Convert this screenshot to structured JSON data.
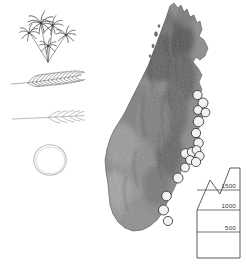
{
  "figure": {
    "background_color": "#ffffff"
  },
  "specimens": {
    "items": [
      {
        "id": "habit",
        "icon": "palm-cluster-icon",
        "label": "Palm habit (cluster of four palms)"
      },
      {
        "id": "leaf",
        "icon": "pinnate-leaf-icon",
        "label": "Pinnate leaf / frond"
      },
      {
        "id": "inflorescence",
        "icon": "branch-icon",
        "label": "Inflorescence branch"
      },
      {
        "id": "fruit",
        "icon": "fruit-circle-icon",
        "label": "Fruit (circular outline)"
      }
    ]
  },
  "map": {
    "name": "Madagascar",
    "relief_shading": true,
    "land_color": "#7d7d7d",
    "ocean_color": "#ffffff",
    "marker": {
      "shape": "circle",
      "fill": "#f2f2f2",
      "stroke": "#2b2b2b",
      "count": 18,
      "description": "Collection / occurrence localities along the eastern escarpment"
    },
    "occurrences": [
      {
        "x": 111.5,
        "y": 95.0,
        "r": 4.6
      },
      {
        "x": 117.0,
        "y": 103.0,
        "r": 5.0
      },
      {
        "x": 112.0,
        "y": 110.0,
        "r": 4.4
      },
      {
        "x": 119.5,
        "y": 112.5,
        "r": 4.4
      },
      {
        "x": 112.5,
        "y": 121.5,
        "r": 5.2
      },
      {
        "x": 110.0,
        "y": 133.0,
        "r": 4.6
      },
      {
        "x": 112.5,
        "y": 143.0,
        "r": 4.8
      },
      {
        "x": 99.5,
        "y": 153.5,
        "r": 4.8
      },
      {
        "x": 106.0,
        "y": 152.0,
        "r": 4.6
      },
      {
        "x": 110.5,
        "y": 150.0,
        "r": 4.4
      },
      {
        "x": 113.5,
        "y": 156.0,
        "r": 4.6
      },
      {
        "x": 104.0,
        "y": 160.0,
        "r": 4.4
      },
      {
        "x": 110.0,
        "y": 162.0,
        "r": 4.6
      },
      {
        "x": 99.0,
        "y": 167.5,
        "r": 4.4
      },
      {
        "x": 92.0,
        "y": 178.0,
        "r": 5.0
      },
      {
        "x": 80.5,
        "y": 196.0,
        "r": 4.8
      },
      {
        "x": 77.5,
        "y": 210.0,
        "r": 5.0
      },
      {
        "x": 82.0,
        "y": 221.0,
        "r": 4.6
      }
    ]
  },
  "legend": {
    "name": "elevation-legend",
    "unit": "m",
    "shape": "mountain-profile",
    "bands": [
      {
        "label": "1500"
      },
      {
        "label": "1000"
      },
      {
        "label": "500"
      }
    ]
  }
}
